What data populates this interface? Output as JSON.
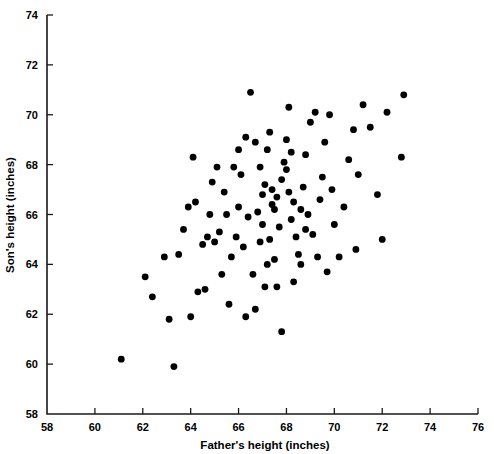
{
  "chart_data": {
    "type": "scatter",
    "title": "",
    "xlabel": "Father's height (inches)",
    "ylabel": "Son's height (inches)",
    "xlim": [
      58,
      76
    ],
    "ylim": [
      58,
      74
    ],
    "xticks": [
      58,
      60,
      62,
      64,
      66,
      68,
      70,
      72,
      74,
      76
    ],
    "yticks": [
      58,
      60,
      62,
      64,
      66,
      68,
      70,
      72,
      74
    ],
    "xtick_labels": [
      "58",
      "60",
      "62",
      "64",
      "66",
      "68",
      "70",
      "72",
      "74",
      "76"
    ],
    "ytick_labels": [
      "58",
      "60",
      "62",
      "64",
      "66",
      "68",
      "70",
      "72",
      "74"
    ],
    "grid": false,
    "legend": "none",
    "marker": "filled-circle",
    "marker_color": "#000000",
    "marker_size": 4.6,
    "n_points": 100,
    "points": [
      [
        61.1,
        60.2
      ],
      [
        63.3,
        59.9
      ],
      [
        62.1,
        63.5
      ],
      [
        62.4,
        62.7
      ],
      [
        62.9,
        64.3
      ],
      [
        63.5,
        64.4
      ],
      [
        63.1,
        61.8
      ],
      [
        64.0,
        61.9
      ],
      [
        64.3,
        62.9
      ],
      [
        64.6,
        63.0
      ],
      [
        63.7,
        65.4
      ],
      [
        64.2,
        66.5
      ],
      [
        64.1,
        68.3
      ],
      [
        64.9,
        67.3
      ],
      [
        65.0,
        64.9
      ],
      [
        65.3,
        63.6
      ],
      [
        65.6,
        62.4
      ],
      [
        64.8,
        66.0
      ],
      [
        65.4,
        66.9
      ],
      [
        65.2,
        65.3
      ],
      [
        65.8,
        67.9
      ],
      [
        65.9,
        65.1
      ],
      [
        65.7,
        64.3
      ],
      [
        66.0,
        66.3
      ],
      [
        66.1,
        67.6
      ],
      [
        66.3,
        69.1
      ],
      [
        66.0,
        68.6
      ],
      [
        66.5,
        70.9
      ],
      [
        66.4,
        65.9
      ],
      [
        66.2,
        64.7
      ],
      [
        66.6,
        63.6
      ],
      [
        66.7,
        62.2
      ],
      [
        66.9,
        64.9
      ],
      [
        66.8,
        66.1
      ],
      [
        67.0,
        66.8
      ],
      [
        67.1,
        67.2
      ],
      [
        66.9,
        67.9
      ],
      [
        67.2,
        68.6
      ],
      [
        67.3,
        69.3
      ],
      [
        67.4,
        66.4
      ],
      [
        67.0,
        65.6
      ],
      [
        67.3,
        65.0
      ],
      [
        67.5,
        64.2
      ],
      [
        67.6,
        63.1
      ],
      [
        67.8,
        61.3
      ],
      [
        67.7,
        65.5
      ],
      [
        67.5,
        66.2
      ],
      [
        67.6,
        66.7
      ],
      [
        67.4,
        67.0
      ],
      [
        67.8,
        67.4
      ],
      [
        67.9,
        68.1
      ],
      [
        68.0,
        69.0
      ],
      [
        68.1,
        70.3
      ],
      [
        68.2,
        68.5
      ],
      [
        68.0,
        67.8
      ],
      [
        68.1,
        66.9
      ],
      [
        68.3,
        66.5
      ],
      [
        68.2,
        65.8
      ],
      [
        68.4,
        65.1
      ],
      [
        68.5,
        64.4
      ],
      [
        68.3,
        63.3
      ],
      [
        68.6,
        66.2
      ],
      [
        68.7,
        67.1
      ],
      [
        68.8,
        68.4
      ],
      [
        69.0,
        69.7
      ],
      [
        69.2,
        70.1
      ],
      [
        68.9,
        66.0
      ],
      [
        69.1,
        65.2
      ],
      [
        69.3,
        64.3
      ],
      [
        69.4,
        66.6
      ],
      [
        69.5,
        67.5
      ],
      [
        69.6,
        68.9
      ],
      [
        69.8,
        70.0
      ],
      [
        69.9,
        67.0
      ],
      [
        70.0,
        65.6
      ],
      [
        70.2,
        64.3
      ],
      [
        70.4,
        66.3
      ],
      [
        70.6,
        68.2
      ],
      [
        70.8,
        69.4
      ],
      [
        71.0,
        67.6
      ],
      [
        71.2,
        70.4
      ],
      [
        71.5,
        69.5
      ],
      [
        71.8,
        66.8
      ],
      [
        72.0,
        65.0
      ],
      [
        72.2,
        70.1
      ],
      [
        72.9,
        70.8
      ],
      [
        72.8,
        68.3
      ],
      [
        70.9,
        64.6
      ],
      [
        65.1,
        67.9
      ],
      [
        64.5,
        64.8
      ],
      [
        66.3,
        61.9
      ],
      [
        69.7,
        63.7
      ],
      [
        67.2,
        64.0
      ],
      [
        65.5,
        66.0
      ],
      [
        68.6,
        64.0
      ],
      [
        66.7,
        68.9
      ],
      [
        63.9,
        66.3
      ],
      [
        64.7,
        65.1
      ],
      [
        68.8,
        65.4
      ],
      [
        67.1,
        63.1
      ]
    ]
  },
  "axes": {
    "x_title": "Father's height (inches)",
    "y_title": "Son's height (inches)"
  }
}
